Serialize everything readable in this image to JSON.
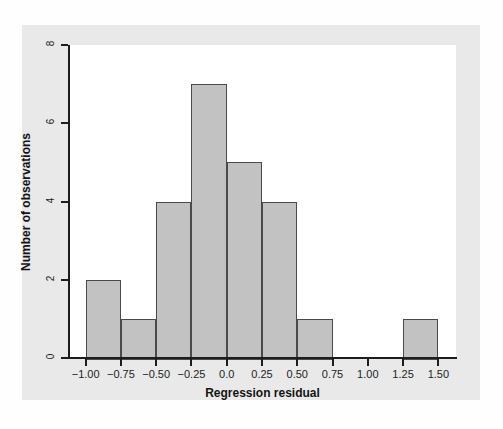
{
  "chart_data": {
    "type": "bar",
    "chart_subtype": "histogram",
    "title": "",
    "xlabel": "Regression residual",
    "ylabel": "Number of observations",
    "xlim": [
      -1.125,
      1.625
    ],
    "ylim": [
      0,
      8
    ],
    "grid": false,
    "legend": null,
    "bin_width": 0.25,
    "x_tick_labels": [
      "-1.00",
      "-0.75",
      "-0.50",
      "-0.25",
      "0.0",
      "0.25",
      "0.50",
      "0.75",
      "1.00",
      "1.25",
      "1.50"
    ],
    "x_tick_values": [
      -1.0,
      -0.75,
      -0.5,
      -0.25,
      0.0,
      0.25,
      0.5,
      0.75,
      1.0,
      1.25,
      1.5
    ],
    "y_tick_labels": [
      "0",
      "2",
      "4",
      "6",
      "8"
    ],
    "y_tick_values": [
      0,
      2,
      4,
      6,
      8
    ],
    "bins": [
      {
        "left": -1.0,
        "right": -0.75,
        "count": 2
      },
      {
        "left": -0.75,
        "right": -0.5,
        "count": 1
      },
      {
        "left": -0.5,
        "right": -0.25,
        "count": 4
      },
      {
        "left": -0.25,
        "right": 0.0,
        "count": 7
      },
      {
        "left": 0.0,
        "right": 0.25,
        "count": 5
      },
      {
        "left": 0.25,
        "right": 0.5,
        "count": 4
      },
      {
        "left": 0.5,
        "right": 0.75,
        "count": 1
      },
      {
        "left": 0.75,
        "right": 1.0,
        "count": 0
      },
      {
        "left": 1.0,
        "right": 1.25,
        "count": 0
      },
      {
        "left": 1.25,
        "right": 1.5,
        "count": 1
      }
    ],
    "categories": [
      "-1.00 to -0.75",
      "-0.75 to -0.50",
      "-0.50 to -0.25",
      "-0.25 to 0.00",
      "0.00 to 0.25",
      "0.25 to 0.50",
      "0.50 to 0.75",
      "0.75 to 1.00",
      "1.00 to 1.25",
      "1.25 to 1.50"
    ],
    "values": [
      2,
      1,
      4,
      7,
      5,
      4,
      1,
      0,
      0,
      1
    ],
    "total_observations": 25,
    "colors": {
      "bar_fill": "#c2c2c2",
      "bar_edge": "#4a4a4a",
      "axis": "#1d1d1d",
      "plot_background": "#ffffff",
      "figure_background": "#e9e9e9",
      "text": "#141414"
    }
  }
}
